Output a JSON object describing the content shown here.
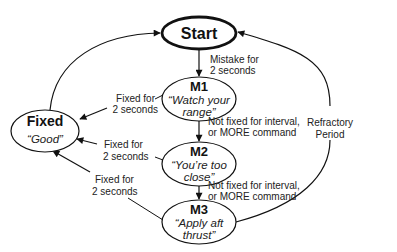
{
  "diagram": {
    "type": "state-machine",
    "nodes": {
      "start": {
        "title": "Start"
      },
      "m1": {
        "title": "M1",
        "line1": "“Watch your",
        "line2": "range”"
      },
      "m2": {
        "title": "M2",
        "line1": "“You’re too",
        "line2": "close”"
      },
      "m3": {
        "title": "M3",
        "line1": "“Apply aft",
        "line2": "thrust”"
      },
      "fixed": {
        "title": "Fixed",
        "line1": "“Good”"
      }
    },
    "edges": {
      "start_m1": {
        "line1": "Mistake for",
        "line2": "2 seconds"
      },
      "m1_m2": {
        "line1": "Not fixed for interval,",
        "line2": "or MORE command"
      },
      "m2_m3": {
        "line1": "Not fixed for interval,",
        "line2": "or MORE command"
      },
      "m1_fixed": {
        "line1": "Fixed for",
        "line2": "2 seconds"
      },
      "m2_fixed": {
        "line1": "Fixed for",
        "line2": "2 seconds"
      },
      "m3_fixed": {
        "line1": "Fixed for",
        "line2": "2 seconds"
      },
      "m3_start": {
        "line1": "Refractory",
        "line2": "Period"
      },
      "fixed_start": {
        "line1": ""
      }
    }
  }
}
